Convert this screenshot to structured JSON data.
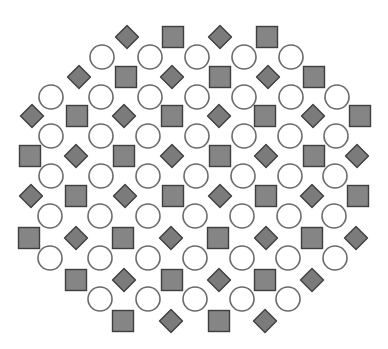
{
  "pattern": {
    "background": "#ffffff",
    "styles": {
      "square": {
        "size": 21,
        "fill": "#858585",
        "stroke": "#3f3f3f",
        "stroke_width": 1.4
      },
      "diamond": {
        "size": 23,
        "fill": "#7b7b7b",
        "stroke": "#3f3f3f",
        "stroke_width": 1.4
      },
      "circle": {
        "diameter": 24,
        "fill": "#ffffff",
        "stroke": "#6a6a6a",
        "stroke_width": 1.6
      }
    },
    "rows": [
      {
        "y": 37,
        "shapes": [
          [
            "diamond",
            127
          ],
          [
            "square",
            173
          ],
          [
            "diamond",
            220
          ],
          [
            "square",
            267
          ]
        ]
      },
      {
        "y": 57,
        "shapes": [
          [
            "circle",
            102
          ],
          [
            "circle",
            150
          ],
          [
            "circle",
            197
          ],
          [
            "circle",
            244
          ],
          [
            "circle",
            291
          ]
        ]
      },
      {
        "y": 77,
        "shapes": [
          [
            "diamond",
            79
          ],
          [
            "square",
            126
          ],
          [
            "diamond",
            172
          ],
          [
            "square",
            220
          ],
          [
            "diamond",
            268
          ],
          [
            "square",
            314
          ]
        ]
      },
      {
        "y": 97,
        "shapes": [
          [
            "circle",
            51
          ],
          [
            "circle",
            101
          ],
          [
            "circle",
            150
          ],
          [
            "circle",
            197
          ],
          [
            "circle",
            244
          ],
          [
            "circle",
            291
          ],
          [
            "circle",
            337
          ]
        ]
      },
      {
        "y": 116,
        "shapes": [
          [
            "diamond",
            32
          ],
          [
            "square",
            77
          ],
          [
            "diamond",
            124
          ],
          [
            "square",
            172
          ],
          [
            "diamond",
            219
          ],
          [
            "square",
            265
          ],
          [
            "diamond",
            313
          ],
          [
            "square",
            360
          ]
        ]
      },
      {
        "y": 136,
        "shapes": [
          [
            "circle",
            51
          ],
          [
            "circle",
            101
          ],
          [
            "circle",
            148
          ],
          [
            "circle",
            197
          ],
          [
            "circle",
            244
          ],
          [
            "circle",
            290
          ],
          [
            "circle",
            336
          ]
        ]
      },
      {
        "y": 156,
        "shapes": [
          [
            "square",
            30
          ],
          [
            "diamond",
            76
          ],
          [
            "square",
            124
          ],
          [
            "diamond",
            172
          ],
          [
            "square",
            220
          ],
          [
            "diamond",
            266
          ],
          [
            "square",
            314
          ],
          [
            "diamond",
            357
          ]
        ]
      },
      {
        "y": 176,
        "shapes": [
          [
            "circle",
            51
          ],
          [
            "circle",
            101
          ],
          [
            "circle",
            148
          ],
          [
            "circle",
            196
          ],
          [
            "circle",
            243
          ],
          [
            "circle",
            290
          ],
          [
            "circle",
            335
          ]
        ]
      },
      {
        "y": 196,
        "shapes": [
          [
            "diamond",
            31
          ],
          [
            "square",
            76
          ],
          [
            "diamond",
            125
          ],
          [
            "square",
            173
          ],
          [
            "diamond",
            220
          ],
          [
            "square",
            266
          ],
          [
            "diamond",
            312
          ],
          [
            "square",
            358
          ]
        ]
      },
      {
        "y": 216,
        "shapes": [
          [
            "circle",
            50
          ],
          [
            "circle",
            100
          ],
          [
            "circle",
            148
          ],
          [
            "circle",
            195
          ],
          [
            "circle",
            242
          ],
          [
            "circle",
            289
          ],
          [
            "circle",
            334
          ]
        ]
      },
      {
        "y": 238,
        "shapes": [
          [
            "square",
            29
          ],
          [
            "diamond",
            76
          ],
          [
            "square",
            123
          ],
          [
            "diamond",
            171
          ],
          [
            "square",
            218
          ],
          [
            "diamond",
            266
          ],
          [
            "square",
            312
          ],
          [
            "diamond",
            356
          ]
        ]
      },
      {
        "y": 258,
        "shapes": [
          [
            "circle",
            50
          ],
          [
            "circle",
            100
          ],
          [
            "circle",
            148
          ],
          [
            "circle",
            195
          ],
          [
            "circle",
            242
          ],
          [
            "circle",
            288
          ],
          [
            "circle",
            335
          ]
        ]
      },
      {
        "y": 280,
        "shapes": [
          [
            "square",
            76
          ],
          [
            "diamond",
            124
          ],
          [
            "square",
            172
          ],
          [
            "diamond",
            219
          ],
          [
            "square",
            265
          ],
          [
            "diamond",
            312
          ]
        ]
      },
      {
        "y": 299,
        "shapes": [
          [
            "circle",
            100
          ],
          [
            "circle",
            148
          ],
          [
            "circle",
            195
          ],
          [
            "circle",
            242
          ],
          [
            "circle",
            288
          ]
        ]
      },
      {
        "y": 321,
        "shapes": [
          [
            "square",
            123
          ],
          [
            "diamond",
            171
          ],
          [
            "square",
            219
          ],
          [
            "diamond",
            265
          ]
        ]
      }
    ]
  }
}
